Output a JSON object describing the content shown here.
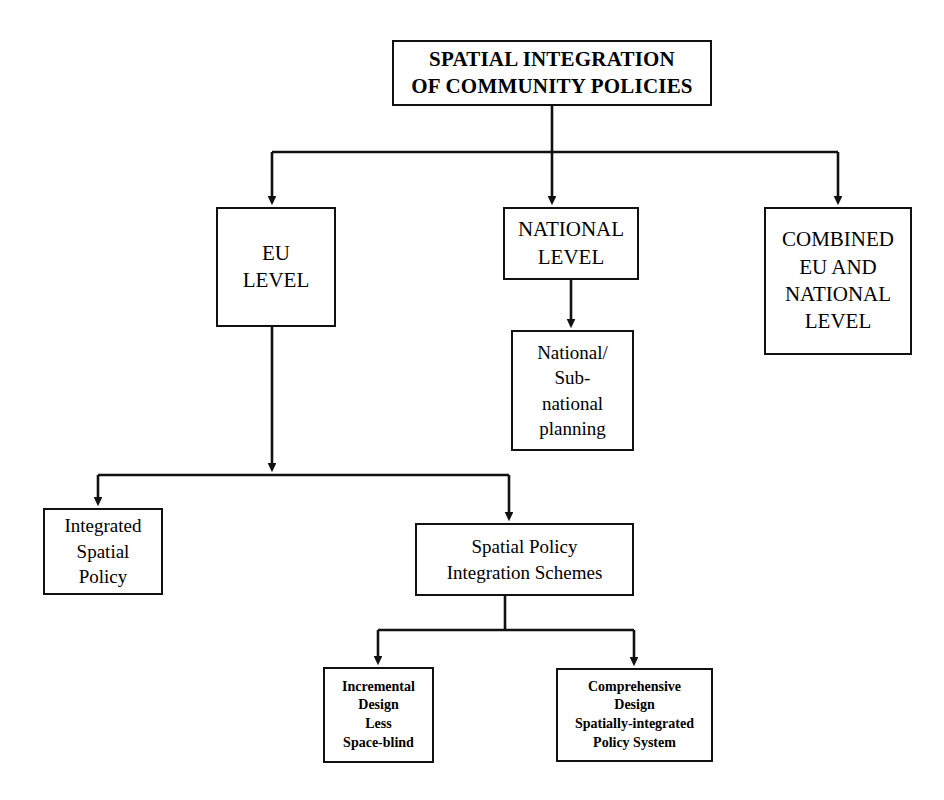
{
  "diagram": {
    "title": "SPATIAL INTEGRATION OF COMMUNITY POLICIES",
    "type": "flowchart",
    "orientation": "top-down",
    "background_color": "#ffffff",
    "line_color": "#111111",
    "text_color": "#000000",
    "nodes": {
      "root": {
        "label": "SPATIAL INTEGRATION\nOF COMMUNITY POLICIES",
        "tier": "root",
        "x": 392,
        "y": 40,
        "w": 320,
        "h": 66
      },
      "eu_level": {
        "label": "EU\nLEVEL",
        "tier": "two",
        "x": 216,
        "y": 207,
        "w": 120,
        "h": 120
      },
      "national_level": {
        "label": "NATIONAL\nLEVEL",
        "tier": "two",
        "x": 503,
        "y": 207,
        "w": 136,
        "h": 73
      },
      "combined_level": {
        "label": "COMBINED\nEU AND\nNATIONAL\nLEVEL",
        "tier": "two",
        "x": 764,
        "y": 207,
        "w": 148,
        "h": 148
      },
      "national_subnational_planning": {
        "label": "National/\nSub-\nnational\nplanning",
        "tier": "three",
        "x": 511,
        "y": 330,
        "w": 123,
        "h": 121
      },
      "integrated_spatial_policy": {
        "label": "Integrated\nSpatial\nPolicy",
        "tier": "three",
        "x": 43,
        "y": 508,
        "w": 120,
        "h": 87
      },
      "spatial_policy_integration_schemes": {
        "label": "Spatial Policy\nIntegration Schemes",
        "tier": "three",
        "x": 415,
        "y": 523,
        "w": 219,
        "h": 73
      },
      "incremental_design": {
        "label": "Incremental\nDesign\nLess\nSpace-blind",
        "tier": "leaf",
        "x": 323,
        "y": 667,
        "w": 111,
        "h": 96
      },
      "comprehensive_design": {
        "label": "Comprehensive\nDesign\nSpatially-integrated\nPolicy System",
        "tier": "leaf",
        "x": 556,
        "y": 668,
        "w": 157,
        "h": 94
      }
    },
    "edges": [
      {
        "from": "root",
        "to": "eu_level",
        "style": "elbow-bus"
      },
      {
        "from": "root",
        "to": "national_level",
        "style": "straight"
      },
      {
        "from": "root",
        "to": "combined_level",
        "style": "elbow-bus"
      },
      {
        "from": "national_level",
        "to": "national_subnational_planning",
        "style": "straight"
      },
      {
        "from": "eu_level",
        "to": "integrated_spatial_policy",
        "style": "elbow-bus"
      },
      {
        "from": "eu_level",
        "to": "spatial_policy_integration_schemes",
        "style": "elbow-bus"
      },
      {
        "from": "spatial_policy_integration_schemes",
        "to": "incremental_design",
        "style": "elbow-bus"
      },
      {
        "from": "spatial_policy_integration_schemes",
        "to": "comprehensive_design",
        "style": "elbow-bus"
      }
    ]
  }
}
